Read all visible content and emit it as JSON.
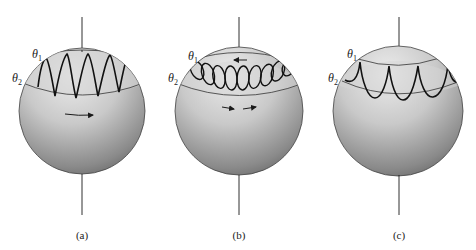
{
  "figure": {
    "panels": [
      {
        "id": "a",
        "caption": "(a)",
        "theta1_label": "θ",
        "theta1_sub": "1",
        "theta2_label": "θ",
        "theta2_sub": "2",
        "trajectory": "sinusoidal oscillation between θ1 and θ2",
        "arrows": [
          "eastward drift"
        ]
      },
      {
        "id": "b",
        "caption": "(b)",
        "theta1_label": "θ",
        "theta1_sub": "1",
        "theta2_label": "θ",
        "theta2_sub": "2",
        "trajectory": "looping trajectory between θ1 and θ2",
        "arrows": [
          "westward at top",
          "eastward",
          "eastward"
        ]
      },
      {
        "id": "c",
        "caption": "(c)",
        "theta1_label": "θ",
        "theta1_sub": "1",
        "theta2_label": "θ",
        "theta2_sub": "2",
        "trajectory": "cusped trajectory touching θ1",
        "arrows": []
      }
    ],
    "colors": {
      "sphere_light": "#e6e6e6",
      "sphere_dark": "#6e6e6e",
      "stroke": "#1a1a1a",
      "band": "#d8d8d8"
    }
  }
}
